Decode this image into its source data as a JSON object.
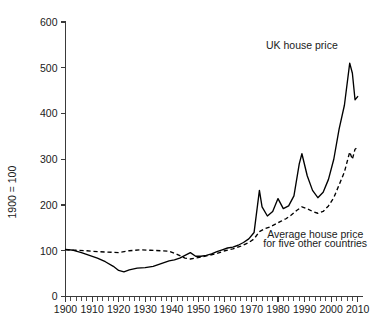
{
  "chart_data": {
    "type": "line",
    "title": "",
    "xlabel": "",
    "ylabel": "1900 = 100",
    "xlim": [
      1900,
      2012
    ],
    "ylim": [
      0,
      600
    ],
    "grid": false,
    "legend_position": "inline-annotations",
    "y_ticks": [
      0,
      100,
      200,
      300,
      400,
      500,
      600
    ],
    "y_tick_labels": [
      "0",
      "100",
      "200",
      "300",
      "400",
      "500",
      "600"
    ],
    "x_ticks": [
      1900,
      1910,
      1920,
      1930,
      1940,
      1950,
      1960,
      1970,
      1980,
      1990,
      2000,
      2010
    ],
    "x_tick_labels": [
      "1900",
      "1910",
      "1920",
      "1930",
      "1940",
      "1950",
      "1960",
      "1970",
      "1980",
      "1990",
      "2000",
      "2010"
    ],
    "x_minor_tick_interval": 2,
    "annotations": [
      {
        "name": "uk-house-price",
        "text": "UK house price",
        "x": 1989,
        "y": 540
      },
      {
        "name": "other-countries",
        "text": "Average house price",
        "x": 1994,
        "y": 128
      },
      {
        "name": "other-countries-line2",
        "text": "for five other countries",
        "x": 1994,
        "y": 108
      }
    ],
    "series": [
      {
        "name": "UK house price",
        "style": "solid",
        "x": [
          1900,
          1903,
          1906,
          1909,
          1912,
          1915,
          1918,
          1920,
          1922,
          1924,
          1927,
          1930,
          1933,
          1936,
          1939,
          1941,
          1943,
          1945,
          1947,
          1949,
          1951,
          1953,
          1955,
          1957,
          1959,
          1961,
          1963,
          1965,
          1967,
          1969,
          1971,
          1973,
          1974,
          1976,
          1978,
          1980,
          1982,
          1984,
          1986,
          1988,
          1989,
          1991,
          1993,
          1995,
          1997,
          1999,
          2001,
          2003,
          2005,
          2007,
          2008,
          2009,
          2010
        ],
        "values": [
          103,
          101,
          96,
          90,
          84,
          76,
          66,
          57,
          54,
          58,
          62,
          63,
          66,
          72,
          78,
          80,
          84,
          90,
          96,
          88,
          88,
          90,
          93,
          98,
          102,
          106,
          108,
          112,
          118,
          126,
          140,
          232,
          196,
          176,
          186,
          214,
          192,
          198,
          220,
          290,
          312,
          264,
          232,
          216,
          228,
          256,
          300,
          366,
          418,
          510,
          488,
          430,
          437
        ]
      },
      {
        "name": "Average house price for five other countries",
        "style": "dashed",
        "x": [
          1900,
          1904,
          1908,
          1912,
          1916,
          1920,
          1924,
          1928,
          1932,
          1936,
          1939,
          1942,
          1945,
          1947,
          1949,
          1951,
          1954,
          1957,
          1960,
          1963,
          1966,
          1969,
          1971,
          1973,
          1975,
          1977,
          1979,
          1981,
          1983,
          1985,
          1987,
          1989,
          1991,
          1993,
          1995,
          1997,
          1999,
          2001,
          2003,
          2005,
          2007,
          2008,
          2009,
          2010
        ],
        "values": [
          102,
          101,
          100,
          98,
          97,
          96,
          100,
          102,
          101,
          100,
          99,
          92,
          84,
          82,
          84,
          86,
          90,
          94,
          100,
          104,
          110,
          118,
          126,
          142,
          148,
          152,
          158,
          164,
          170,
          178,
          188,
          196,
          192,
          186,
          182,
          186,
          198,
          216,
          244,
          272,
          316,
          300,
          322,
          326
        ]
      }
    ]
  }
}
